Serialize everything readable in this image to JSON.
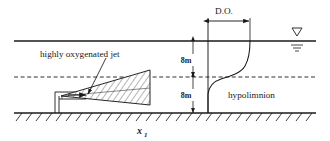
{
  "figure": {
    "width": 330,
    "height": 141,
    "background": "#ffffff",
    "line_color": "#1a1a1a",
    "text_color": "#1a1a1a"
  },
  "labels": {
    "jet": "highly oxygenated jet",
    "hypolimnion": "hypolimnion",
    "do": "D.O.",
    "depth_upper": "8m",
    "depth_lower": "8m",
    "axis_x": "x",
    "axis_x_sub": "1"
  },
  "diagram_data": {
    "type": "schematic-cross-section",
    "description": "Cross-section of a lake showing a highly oxygenated jet discharged near the bed and the resulting dissolved oxygen (D.O.) vertical profile",
    "levels": [
      {
        "name": "water-surface",
        "y_px": 41,
        "style": "solid",
        "label": "water surface"
      },
      {
        "name": "thermocline",
        "y_px": 77,
        "style": "dashed",
        "label": "thermocline / metalimnion boundary"
      },
      {
        "name": "bed",
        "y_px": 113,
        "style": "solid-hatched",
        "label": "lake bed"
      }
    ],
    "depths": [
      {
        "from": "water-surface",
        "to": "thermocline",
        "value": "8m"
      },
      {
        "from": "thermocline",
        "to": "bed",
        "value": "8m"
      }
    ],
    "layers": [
      {
        "name": "epilimnion",
        "between": [
          "water-surface",
          "thermocline"
        ]
      },
      {
        "name": "hypolimnion",
        "between": [
          "thermocline",
          "bed"
        ]
      }
    ],
    "do_profile": {
      "label": "D.O.",
      "shape": "sigmoid",
      "axis_x_px": 208,
      "max_x_px": 250,
      "note": "Low D.O. in hypolimnion increasing sharply across the thermocline to high D.O. near the surface"
    },
    "jet": {
      "label": "highly oxygenated jet",
      "shape": "triangular-hatched-wedge",
      "origin": "nozzle at bed",
      "spreads": "upward and rightward toward the thermocline"
    }
  }
}
